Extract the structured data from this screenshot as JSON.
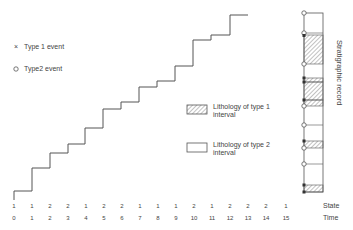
{
  "legend": {
    "type1_event": "Type 1 event",
    "type2_event": "Type2 event",
    "type1_lithology_line1": "Lithology of type 1",
    "type1_lithology_line2": "interval",
    "type2_lithology_line1": "Lithology of type 2",
    "type2_lithology_line2": "interval"
  },
  "axis": {
    "state_label": "State",
    "time_label": "Time",
    "column_label": "Stratigraphic record"
  },
  "states": [
    "1",
    "1",
    "2",
    "2",
    "1",
    "2",
    "2",
    "1",
    "1",
    "1",
    "2",
    "1",
    "2",
    "2",
    "2",
    "1"
  ],
  "times": [
    "0",
    "1",
    "2",
    "3",
    "4",
    "5",
    "6",
    "7",
    "8",
    "9",
    "10",
    "11",
    "12",
    "13",
    "14",
    "15"
  ],
  "colors": {
    "line": "#555555",
    "hatch": "#777777",
    "background": "#ffffff"
  }
}
